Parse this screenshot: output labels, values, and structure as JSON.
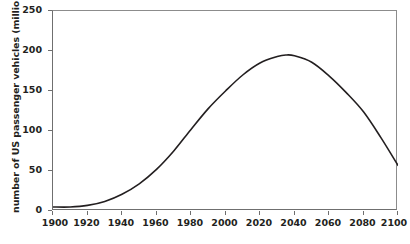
{
  "chart_data": {
    "type": "line",
    "title": "",
    "xlabel": "",
    "ylabel": "number of US passenger vehicles (million)",
    "xlim": [
      1900,
      2100
    ],
    "ylim": [
      0,
      250
    ],
    "xticks": [
      1900,
      1920,
      1940,
      1960,
      1980,
      2000,
      2020,
      2040,
      2060,
      2080,
      2100
    ],
    "yticks": [
      0,
      50,
      100,
      150,
      200,
      250
    ],
    "grid": false,
    "legend": "none",
    "line_color": "#231f20",
    "axis_color": "#6f6f6f",
    "series": [
      {
        "name": "US passenger vehicles",
        "x": [
          1900,
          1910,
          1920,
          1930,
          1940,
          1950,
          1960,
          1970,
          1980,
          1990,
          2000,
          2010,
          2020,
          2030,
          2035,
          2040,
          2050,
          2060,
          2070,
          2080,
          2090,
          2100
        ],
        "values": [
          5,
          5,
          7,
          12,
          21,
          34,
          52,
          75,
          102,
          128,
          150,
          170,
          185,
          193,
          195,
          194,
          186,
          169,
          148,
          124,
          92,
          57
        ]
      }
    ]
  },
  "axis": {
    "y_title": "number of US passenger vehicles (million)",
    "y_tick_labels": [
      "250",
      "200",
      "150",
      "100",
      "50",
      "0"
    ],
    "x_tick_labels": [
      "1900",
      "1920",
      "1940",
      "1960",
      "1980",
      "2000",
      "2020",
      "2040",
      "2060",
      "2080",
      "2100"
    ]
  }
}
